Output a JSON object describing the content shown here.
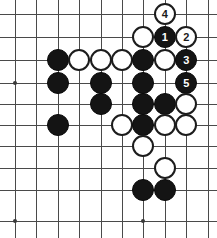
{
  "diagram": {
    "kind": "go-board-diagram",
    "title": "",
    "board": {
      "line_color": "#4a4a4a",
      "background_color": "#ffffff",
      "columns": 10,
      "rows": 10,
      "x_positions": [
        15,
        36.4,
        57.8,
        79.2,
        100.6,
        122,
        143.4,
        164.8,
        186.2,
        207.6
      ],
      "y_positions": [
        14,
        37,
        60,
        83,
        104,
        125,
        146,
        168,
        190,
        221
      ],
      "star_points": [
        {
          "col": 0,
          "row": 3
        },
        {
          "col": 0,
          "row": 9
        },
        {
          "col": 6,
          "row": 9
        }
      ]
    },
    "stone_colors": {
      "black_fill": "#141414",
      "black_label": "#ffffff",
      "white_fill": "#ffffff",
      "white_border": "#1c1c1c",
      "white_label": "#1a1a1a"
    },
    "stone_radius": 11,
    "stones": [
      {
        "name": "white-move-4",
        "color": "white",
        "col": 7,
        "row": 0,
        "label": "4"
      },
      {
        "name": "white-stone-c6r1",
        "color": "white",
        "col": 6,
        "row": 1,
        "label": ""
      },
      {
        "name": "black-move-1",
        "color": "black",
        "col": 7,
        "row": 1,
        "label": "1"
      },
      {
        "name": "white-move-2",
        "color": "white",
        "col": 8,
        "row": 1,
        "label": "2"
      },
      {
        "name": "black-stone-c2r2",
        "color": "black",
        "col": 2,
        "row": 2,
        "label": ""
      },
      {
        "name": "white-stone-c3r2",
        "color": "white",
        "col": 3,
        "row": 2,
        "label": ""
      },
      {
        "name": "white-stone-c4r2",
        "color": "white",
        "col": 4,
        "row": 2,
        "label": ""
      },
      {
        "name": "white-stone-c5r2",
        "color": "white",
        "col": 5,
        "row": 2,
        "label": ""
      },
      {
        "name": "black-stone-c6r2",
        "color": "black",
        "col": 6,
        "row": 2,
        "label": ""
      },
      {
        "name": "white-stone-c7r2",
        "color": "white",
        "col": 7,
        "row": 2,
        "label": ""
      },
      {
        "name": "black-move-3",
        "color": "black",
        "col": 8,
        "row": 2,
        "label": "3"
      },
      {
        "name": "black-stone-c2r3",
        "color": "black",
        "col": 2,
        "row": 3,
        "label": ""
      },
      {
        "name": "black-stone-c4r3",
        "color": "black",
        "col": 4,
        "row": 3,
        "label": ""
      },
      {
        "name": "black-stone-c6r3",
        "color": "black",
        "col": 6,
        "row": 3,
        "label": ""
      },
      {
        "name": "black-move-5",
        "color": "black",
        "col": 8,
        "row": 3,
        "label": "5"
      },
      {
        "name": "black-stone-c4r4",
        "color": "black",
        "col": 4,
        "row": 4,
        "label": ""
      },
      {
        "name": "black-stone-c6r4",
        "color": "black",
        "col": 6,
        "row": 4,
        "label": ""
      },
      {
        "name": "black-stone-c7r4",
        "color": "black",
        "col": 7,
        "row": 4,
        "label": ""
      },
      {
        "name": "white-stone-c8r4",
        "color": "white",
        "col": 8,
        "row": 4,
        "label": ""
      },
      {
        "name": "black-stone-c2r5",
        "color": "black",
        "col": 2,
        "row": 5,
        "label": ""
      },
      {
        "name": "white-stone-c5r5",
        "color": "white",
        "col": 5,
        "row": 5,
        "label": ""
      },
      {
        "name": "black-stone-c6r5",
        "color": "black",
        "col": 6,
        "row": 5,
        "label": ""
      },
      {
        "name": "white-stone-c7r5",
        "color": "white",
        "col": 7,
        "row": 5,
        "label": ""
      },
      {
        "name": "white-stone-c8r5",
        "color": "white",
        "col": 8,
        "row": 5,
        "label": ""
      },
      {
        "name": "white-stone-c6r6",
        "color": "white",
        "col": 6,
        "row": 6,
        "label": ""
      },
      {
        "name": "white-stone-c7r7",
        "color": "white",
        "col": 7,
        "row": 7,
        "label": ""
      },
      {
        "name": "black-stone-c6r8",
        "color": "black",
        "col": 6,
        "row": 8,
        "label": ""
      },
      {
        "name": "black-stone-c7r8",
        "color": "black",
        "col": 7,
        "row": 8,
        "label": ""
      }
    ]
  }
}
